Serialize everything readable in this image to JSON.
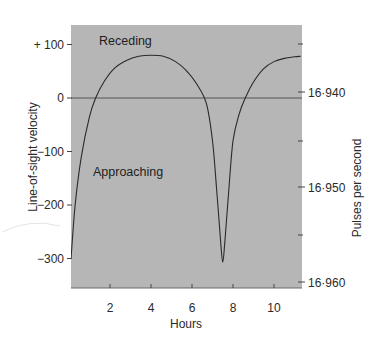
{
  "chart_data": {
    "type": "line",
    "title": "",
    "xlabel": "Hours",
    "ylabel": "Line-of-sight velocity",
    "y2label": "Pulses per second",
    "xlim": [
      0,
      11.3
    ],
    "ylim": [
      -355,
      130
    ],
    "x_ticks": [
      2,
      4,
      6,
      8,
      10
    ],
    "x_tick_labels": [
      "2",
      "4",
      "6",
      "8",
      "10"
    ],
    "y_ticks": [
      100,
      0,
      -100,
      -200,
      -300
    ],
    "y_tick_labels": [
      "+ 100",
      "0",
      "−100",
      "−200",
      "−300"
    ],
    "y2_ticks": [
      {
        "label": "16·940",
        "velocity": -11
      },
      {
        "label": "16·950",
        "velocity": -168
      },
      {
        "label": "16·960",
        "velocity": -345
      }
    ],
    "y2_minor_ticks_velocity": [
      100,
      -80,
      -257
    ],
    "grid": false,
    "zero_line": true,
    "annotations": [
      {
        "text": "Receding",
        "x": 3.2,
        "y": 110
      },
      {
        "text": "Approaching",
        "x": 2.1,
        "y": -135
      }
    ],
    "series": [
      {
        "name": "velocity",
        "x": [
          0.1,
          0.3,
          0.6,
          1.0,
          1.3,
          1.7,
          2.2,
          2.8,
          3.4,
          4.0,
          4.6,
          5.2,
          5.7,
          6.2,
          6.7,
          7.0,
          7.2,
          7.4,
          7.5,
          7.6,
          7.8,
          8.0,
          8.3,
          8.6,
          9.0,
          9.5,
          10.0,
          10.5,
          11.0,
          11.3
        ],
        "y": [
          -300,
          -200,
          -110,
          -35,
          0,
          30,
          55,
          70,
          78,
          80,
          78,
          68,
          52,
          28,
          -10,
          -80,
          -170,
          -270,
          -307,
          -270,
          -170,
          -80,
          -30,
          0,
          30,
          55,
          68,
          74,
          77,
          78
        ]
      }
    ]
  },
  "labels": {
    "receding": "Receding",
    "approaching": "Approaching",
    "xlabel": "Hours",
    "ylabel": "Line-of-sight velocity",
    "y2label": "Pulses per second"
  },
  "colors": {
    "plot_bg": "#b6b6b6",
    "line": "#2a2a2a",
    "page_bg": "#ffffff"
  }
}
